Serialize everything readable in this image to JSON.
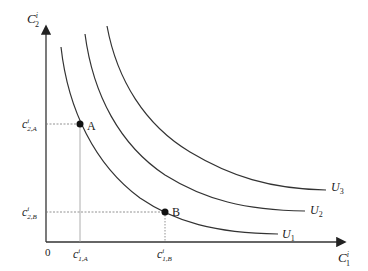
{
  "diagram": {
    "type": "indifference-curves",
    "axes": {
      "y_label": {
        "main": "C",
        "sup": "i",
        "sub": "2"
      },
      "x_label": {
        "main": "C",
        "sup": "i",
        "sub": "1"
      },
      "origin": "0"
    },
    "curves": [
      {
        "name": "U1",
        "label_main": "U",
        "label_sub": "1"
      },
      {
        "name": "U2",
        "label_main": "U",
        "label_sub": "2"
      },
      {
        "name": "U3",
        "label_main": "U",
        "label_sub": "3"
      }
    ],
    "points": [
      {
        "name": "A",
        "label": "A",
        "x_tick": {
          "main": "c",
          "sup": "i",
          "sub": "1,A"
        },
        "y_tick": {
          "main": "c",
          "sup": "i",
          "sub": "2,A"
        }
      },
      {
        "name": "B",
        "label": "B",
        "x_tick": {
          "main": "c",
          "sup": "i",
          "sub": "1,B"
        },
        "y_tick": {
          "main": "c",
          "sup": "i",
          "sub": "2,B"
        }
      }
    ],
    "colors": {
      "line": "#333333",
      "guide": "#777777"
    }
  }
}
